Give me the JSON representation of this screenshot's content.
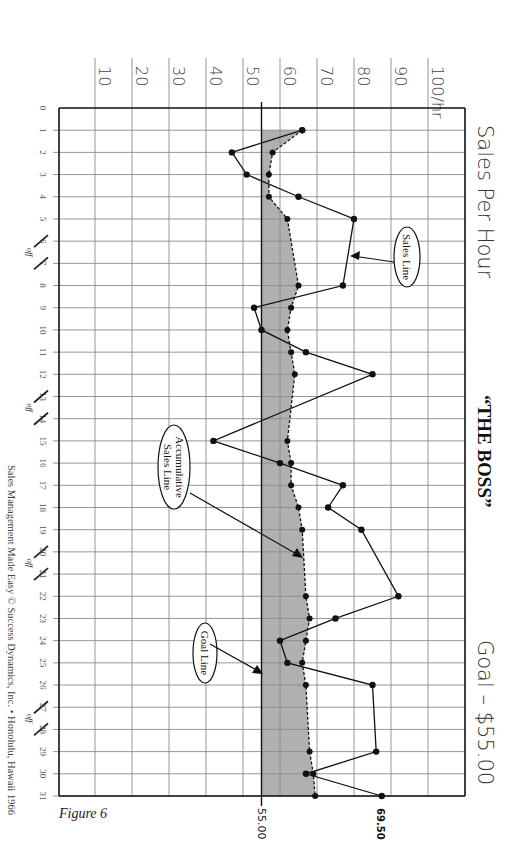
{
  "header": {
    "title_left": "Sales Per Hour",
    "title_center": "“THE BOSS”",
    "title_right": "Goal – $55.00"
  },
  "footer": {
    "copyright": "Sales Management Made Easy © Success Dynamics, Inc. • Honolulu, Hawaii 1966",
    "figure_label": "Figure 6"
  },
  "callouts": {
    "sales_line": "Sales Line",
    "accumulative_line_1": "Accumulative",
    "accumulative_line_2": "Sales Line",
    "goal_line": "Goal Line"
  },
  "value_labels": {
    "goal": "55.00",
    "final": "69.50"
  },
  "off_label": "off",
  "colors": {
    "shade": "#b0b0b0",
    "grid": "#8a8a8a",
    "line": "#111111"
  },
  "chart_data": {
    "type": "line",
    "orientation": "rotated 90° clockwise (days run top-to-bottom, value runs left-to-right)",
    "xlabel": "Day of month",
    "ylabel": "Sales per hour ($/hr)",
    "ylim": [
      0,
      100
    ],
    "y_ticks": [
      "10",
      "20",
      "30",
      "40",
      "50",
      "60",
      "70",
      "80",
      "90",
      "100/hr"
    ],
    "x_ticks": [
      "0",
      "1",
      "2",
      "3",
      "4",
      "5",
      "6",
      "7",
      "8",
      "9",
      "10",
      "11",
      "12",
      "13",
      "14",
      "15",
      "16",
      "17",
      "18",
      "19",
      "20",
      "21",
      "22",
      "23",
      "24",
      "25",
      "26",
      "27",
      "28",
      "29",
      "30",
      "31"
    ],
    "off_days": [
      6,
      7,
      13,
      14,
      20,
      21,
      27,
      28
    ],
    "goal": 55.0,
    "grid": true,
    "series": [
      {
        "name": "Sales Line",
        "style": "solid",
        "days": [
          1,
          2,
          3,
          4,
          5,
          8,
          9,
          10,
          11,
          12,
          15,
          16,
          17,
          18,
          19,
          22,
          23,
          24,
          25,
          26,
          29,
          30,
          31
        ],
        "values": [
          66,
          47,
          51,
          65,
          80,
          77,
          53,
          55,
          67,
          85,
          42,
          60,
          77,
          73,
          82,
          92,
          75,
          60,
          62,
          85,
          86,
          67,
          87.5
        ]
      },
      {
        "name": "Accumulative Sales Line",
        "style": "dashed",
        "days": [
          1,
          2,
          3,
          4,
          5,
          8,
          9,
          10,
          11,
          12,
          15,
          16,
          17,
          18,
          19,
          22,
          23,
          24,
          25,
          26,
          29,
          30,
          31
        ],
        "values": [
          66,
          58,
          57,
          57,
          62,
          65,
          63,
          62,
          63,
          64,
          62,
          63,
          63,
          65,
          66,
          67,
          68,
          67,
          66,
          67,
          68,
          69,
          69.5
        ]
      },
      {
        "name": "Goal Line",
        "style": "solid-vertical",
        "value": 55
      }
    ],
    "annotations": [
      "55.00",
      "69.50",
      "Sales Line",
      "Accumulative Sales Line",
      "Goal Line"
    ]
  }
}
